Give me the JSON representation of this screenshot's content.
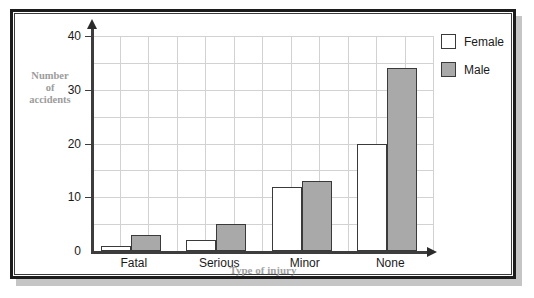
{
  "figure": {
    "scan_artifact_text": "",
    "frame_color": "#1c1c1c",
    "background": "#ffffff"
  },
  "legend": {
    "position": "right",
    "items": [
      {
        "label": "Female",
        "swatch": "legend-swatch-female",
        "color": "#ffffff"
      },
      {
        "label": "Male",
        "swatch": "legend-swatch-male",
        "color": "#a9a9a9"
      }
    ]
  },
  "axes": {
    "y_title_lines": [
      "Number",
      "of",
      "accidents"
    ],
    "x_title": "Type of injury",
    "y_ticks": [
      "0",
      "10",
      "20",
      "30",
      "40"
    ],
    "title_color": "#9c9c9c"
  },
  "chart_data": {
    "type": "bar",
    "title": "",
    "subtitle": "",
    "xlabel": "Type of injury",
    "ylabel": "Number of accidents",
    "categories": [
      "Fatal",
      "Serious",
      "Minor",
      "None"
    ],
    "series": [
      {
        "name": "Female",
        "values": [
          1,
          2,
          12,
          20
        ],
        "color": "#ffffff",
        "edgecolor": "#3a3a3a"
      },
      {
        "name": "Male",
        "values": [
          3,
          5,
          13,
          34
        ],
        "color": "#a9a9a9",
        "edgecolor": "#3a3a3a"
      }
    ],
    "ylim": [
      0,
      40
    ],
    "yticks": [
      0,
      10,
      20,
      30,
      40
    ],
    "grid": true,
    "grid_color": "#d2d2d2",
    "legend_position": "upper right outside",
    "bar_style": "grouped-adjacent"
  }
}
